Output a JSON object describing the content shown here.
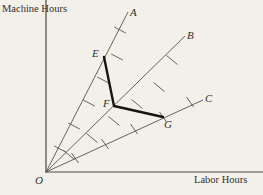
{
  "figure": {
    "type": "isoquant-ray-diagram",
    "background_color": "#f2f0e9",
    "ink_color": "#3a382f",
    "axes": {
      "y_label": "Machine Hours",
      "x_label": "Labor Hours",
      "origin_label": "O",
      "origin_px": {
        "x": 46,
        "y": 172
      },
      "y_axis_top_px": {
        "x": 46,
        "y": 0
      },
      "x_axis_right_px": {
        "x": 263,
        "y": 172
      }
    },
    "rays": [
      {
        "id": "A",
        "label": "A",
        "description": "steepest ray from origin, highest machine-to-labor ratio",
        "end_px": {
          "x": 128,
          "y": 12
        },
        "ticks_px": [
          {
            "x": 60,
            "y": 149
          },
          {
            "x": 74,
            "y": 126
          },
          {
            "x": 89,
            "y": 103
          },
          {
            "x": 103,
            "y": 80
          },
          {
            "x": 117,
            "y": 57
          },
          {
            "x": 120,
            "y": 30
          }
        ]
      },
      {
        "id": "B",
        "label": "B",
        "description": "middle ray from origin, intermediate machine-to-labor ratio",
        "end_px": {
          "x": 185,
          "y": 36
        },
        "ticks_px": [
          {
            "x": 69,
            "y": 155
          },
          {
            "x": 92,
            "y": 138
          },
          {
            "x": 114,
            "y": 121
          },
          {
            "x": 137,
            "y": 104
          },
          {
            "x": 159,
            "y": 87
          },
          {
            "x": 172,
            "y": 60
          }
        ]
      },
      {
        "id": "C",
        "label": "C",
        "description": "flattest ray from origin, lowest machine-to-labor ratio",
        "end_px": {
          "x": 203,
          "y": 100
        },
        "ticks_px": [
          {
            "x": 75,
            "y": 158
          },
          {
            "x": 105,
            "y": 144
          },
          {
            "x": 134,
            "y": 129
          },
          {
            "x": 163,
            "y": 117
          },
          {
            "x": 190,
            "y": 102
          }
        ]
      }
    ],
    "isoquant": {
      "description": "kinked isoquant connecting E on ray A, F on ray B and G on ray C",
      "points": [
        {
          "label": "E",
          "on_ray": "A",
          "px": {
            "x": 104,
            "y": 57
          }
        },
        {
          "label": "F",
          "on_ray": "B",
          "px": {
            "x": 114,
            "y": 106
          }
        },
        {
          "label": "G",
          "on_ray": "C",
          "px": {
            "x": 163,
            "y": 117
          }
        }
      ]
    },
    "labels": {
      "A": "A",
      "B": "B",
      "C": "C",
      "E": "E",
      "F": "F",
      "G": "G",
      "O": "O"
    }
  }
}
